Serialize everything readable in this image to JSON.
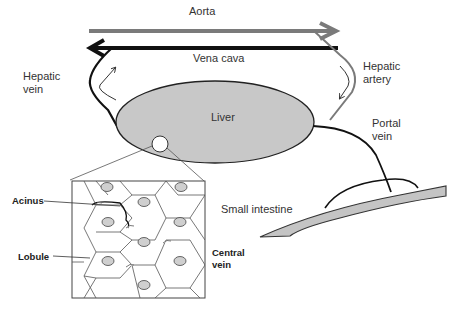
{
  "diagram": {
    "labels": {
      "aorta": "Aorta",
      "vena_cava": "Vena cava",
      "hepatic_vein": "Hepatic\nvein",
      "hepatic_artery": "Hepatic\nartery",
      "liver": "Liver",
      "portal_vein": "Portal\nvein",
      "small_intestine": "Small intestine",
      "acinus": "Acinus",
      "lobule": "Lobule",
      "central_vein": "Central\nvein"
    },
    "colors": {
      "aorta": "#7a7a7a",
      "vena_cava": "#111111",
      "liver_fill": "#c8c8c8",
      "intestine_fill": "#c4c4c4",
      "central_vein_fill": "#cfcfcf",
      "outline": "#333333"
    }
  }
}
